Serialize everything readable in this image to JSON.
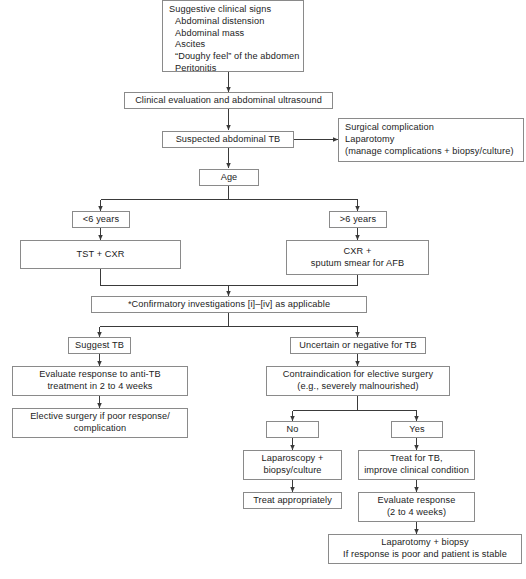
{
  "figure": {
    "type": "flowchart"
  },
  "style": {
    "box_border": "#8a8a8a",
    "connector": "#3a3a3a",
    "text": "#1c1c1c",
    "background": "#ffffff"
  },
  "nodes": {
    "signs": {
      "lines": [
        "Suggestive clinical signs",
        "Abdominal distension",
        "Abdominal mass",
        "Ascites",
        "“Doughy feel” of the abdomen",
        "Peritonitis"
      ]
    },
    "clinical_evaluation": {
      "line1": "Clinical evaluation and abdominal ultrasound"
    },
    "suspected": {
      "line1": "Suspected abdominal TB"
    },
    "surgical_complication": {
      "lines": [
        "Surgical complication",
        "Laparotomy",
        "(manage complications + biopsy/culture)"
      ]
    },
    "age": {
      "line1": "Age"
    },
    "age_under6": {
      "line1": "<6 years"
    },
    "age_over6": {
      "line1": ">6 years"
    },
    "tst_cxr": {
      "line1": "TST + CXR"
    },
    "cxr_sputum": {
      "line1": "CXR +",
      "line2": "sputum smear for AFB"
    },
    "confirmatory": {
      "line1": "*Confirmatory investigations [i]–[iv] as applicable"
    },
    "suggest_tb": {
      "line1": "Suggest TB"
    },
    "uncertain_tb": {
      "line1": "Uncertain or negative for TB"
    },
    "evaluate_anti_tb": {
      "line1": "Evaluate response to anti-TB",
      "line2": "treatment in 2 to 4 weeks"
    },
    "elective_surgery": {
      "line1": "Elective surgery if poor response/",
      "line2": "complication"
    },
    "contraindication": {
      "line1": "Contraindication for elective surgery",
      "line2": "(e.g., severely malnourished)"
    },
    "branch_no": {
      "line1": "No"
    },
    "branch_yes": {
      "line1": "Yes"
    },
    "laparoscopy": {
      "line1": "Laparoscopy +",
      "line2": "biopsy/culture"
    },
    "treat_appropriately": {
      "line1": "Treat appropriately"
    },
    "treat_for_tb": {
      "line1": "Treat for TB,",
      "line2": "improve clinical condition"
    },
    "evaluate_response": {
      "line1": "Evaluate response",
      "line2": "(2 to 4 weeks)"
    },
    "laparotomy_biopsy": {
      "line1": "Laparotomy + biopsy",
      "line2": "If response is poor and patient is stable"
    }
  }
}
